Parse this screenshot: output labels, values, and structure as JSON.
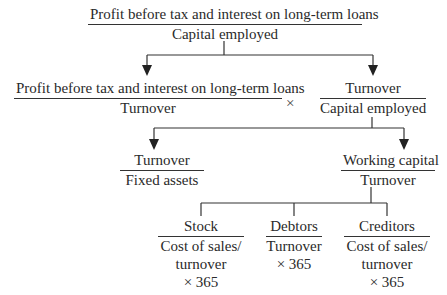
{
  "diagram": {
    "type": "ratio-pyramid",
    "level1": {
      "numerator": "Profit before tax and interest on long-term loans",
      "denominator": "Capital employed"
    },
    "level2": {
      "left": {
        "numerator": "Profit before tax and interest on long-term loans",
        "denominator": "Turnover"
      },
      "operator": "×",
      "right": {
        "numerator": "Turnover",
        "denominator": "Capital employed"
      }
    },
    "level3": {
      "left": {
        "numerator": "Turnover",
        "denominator": "Fixed assets"
      },
      "right": {
        "numerator": "Working capital",
        "denominator": "Turnover"
      }
    },
    "level4": {
      "stock": {
        "numerator": "Stock",
        "denominator_lines": [
          "Cost of sales/",
          "turnover",
          "× 365"
        ]
      },
      "debtors": {
        "numerator": "Debtors",
        "denominator_lines": [
          "Turnover",
          "× 365"
        ]
      },
      "creditors": {
        "numerator": "Creditors",
        "denominator_lines": [
          "Cost of sales/",
          "turnover",
          "× 365"
        ]
      }
    },
    "line_color": "#333333"
  }
}
